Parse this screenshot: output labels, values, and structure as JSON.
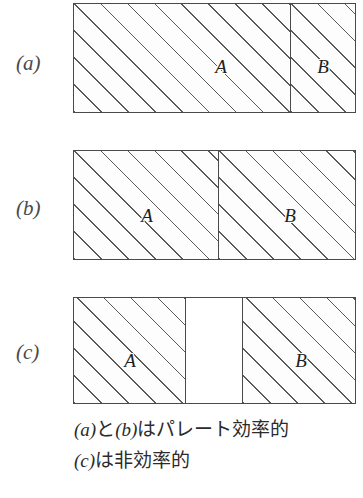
{
  "figure": {
    "type": "diagram",
    "panels": [
      {
        "label": "(a)",
        "regions": [
          {
            "label": "A",
            "fill": "hatched"
          },
          {
            "label": "B",
            "fill": "hatched"
          }
        ]
      },
      {
        "label": "(b)",
        "regions": [
          {
            "label": "A",
            "fill": "hatched"
          },
          {
            "label": "B",
            "fill": "hatched"
          }
        ]
      },
      {
        "label": "(c)",
        "regions": [
          {
            "label": "A",
            "fill": "hatched"
          },
          {
            "label": "",
            "fill": "empty"
          },
          {
            "label": "B",
            "fill": "hatched"
          }
        ]
      }
    ]
  },
  "caption": {
    "line1_prefix": "(a)",
    "line1_mid": "と",
    "line1_ref2": "(b)",
    "line1_suffix": "はパレート効率的",
    "line2_prefix": "(c)",
    "line2_suffix": "は非効率的",
    "line1_full": "(a) と (b) はパレート効率的",
    "line2_full": "(c) は非効率的"
  },
  "colors": {
    "hatch": "#5a5a5a",
    "border": "#4a4a4a",
    "text": "#2b2b2b",
    "background": "#ffffff"
  }
}
